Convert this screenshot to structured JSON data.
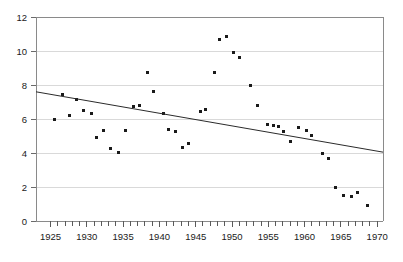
{
  "chart_data": {
    "type": "scatter",
    "title": "",
    "subtitle": "",
    "xlabel": "",
    "ylabel": "",
    "xlim": [
      1923,
      1970.8
    ],
    "ylim": [
      0,
      12
    ],
    "grid": true,
    "legend": null,
    "x_ticks_major": [
      1925,
      1930,
      1935,
      1940,
      1945,
      1950,
      1955,
      1960,
      1965,
      1970
    ],
    "x_tick_labels": [
      "1925",
      "1930",
      "1935",
      "1940",
      "1945",
      "1950",
      "1955",
      "1960",
      "1965",
      "1970"
    ],
    "x_tick_interval": 1,
    "y_ticks": [
      0,
      2,
      4,
      6,
      8,
      10,
      12
    ],
    "y_tick_labels": [
      "0",
      "2",
      "4",
      "6",
      "8",
      "10",
      "12"
    ],
    "series": [
      {
        "name": "observations",
        "marker": "square",
        "color": "#1a1a1a",
        "points": [
          {
            "x": 1925.6,
            "y": 5.95
          },
          {
            "x": 1926.6,
            "y": 7.45
          },
          {
            "x": 1927.6,
            "y": 6.2
          },
          {
            "x": 1928.6,
            "y": 7.15
          },
          {
            "x": 1929.6,
            "y": 6.5
          },
          {
            "x": 1930.6,
            "y": 6.3
          },
          {
            "x": 1931.4,
            "y": 4.9
          },
          {
            "x": 1932.3,
            "y": 5.3
          },
          {
            "x": 1933.3,
            "y": 4.25
          },
          {
            "x": 1934.3,
            "y": 4.05
          },
          {
            "x": 1935.3,
            "y": 5.35
          },
          {
            "x": 1936.4,
            "y": 6.75
          },
          {
            "x": 1937.2,
            "y": 6.8
          },
          {
            "x": 1938.3,
            "y": 8.75
          },
          {
            "x": 1939.2,
            "y": 7.6
          },
          {
            "x": 1940.6,
            "y": 6.35
          },
          {
            "x": 1941.2,
            "y": 5.4
          },
          {
            "x": 1942.2,
            "y": 5.25
          },
          {
            "x": 1943.2,
            "y": 4.3
          },
          {
            "x": 1944.0,
            "y": 4.55
          },
          {
            "x": 1945.6,
            "y": 6.45
          },
          {
            "x": 1946.4,
            "y": 6.55
          },
          {
            "x": 1947.6,
            "y": 8.75
          },
          {
            "x": 1948.3,
            "y": 10.65
          },
          {
            "x": 1949.3,
            "y": 10.85
          },
          {
            "x": 1950.2,
            "y": 9.9
          },
          {
            "x": 1951.1,
            "y": 9.6
          },
          {
            "x": 1952.5,
            "y": 7.95
          },
          {
            "x": 1953.5,
            "y": 6.8
          },
          {
            "x": 1954.9,
            "y": 5.65
          },
          {
            "x": 1955.7,
            "y": 5.6
          },
          {
            "x": 1956.4,
            "y": 5.55
          },
          {
            "x": 1957.1,
            "y": 5.25
          },
          {
            "x": 1958.1,
            "y": 4.7
          },
          {
            "x": 1959.2,
            "y": 5.5
          },
          {
            "x": 1960.2,
            "y": 5.3
          },
          {
            "x": 1961.0,
            "y": 5.05
          },
          {
            "x": 1962.5,
            "y": 3.95
          },
          {
            "x": 1963.3,
            "y": 3.7
          },
          {
            "x": 1964.3,
            "y": 2.0
          },
          {
            "x": 1965.4,
            "y": 1.5
          },
          {
            "x": 1966.4,
            "y": 1.45
          },
          {
            "x": 1967.3,
            "y": 1.7
          },
          {
            "x": 1968.6,
            "y": 0.9
          }
        ]
      }
    ],
    "trend_line": {
      "name": "linear-fit",
      "color": "#2b2b2b",
      "x_start": 1923.0,
      "y_start": 7.6,
      "x_end": 1970.8,
      "y_end": 4.05
    }
  },
  "axes": {
    "y_axis_name": "y-axis",
    "x_axis_name": "x-axis"
  }
}
